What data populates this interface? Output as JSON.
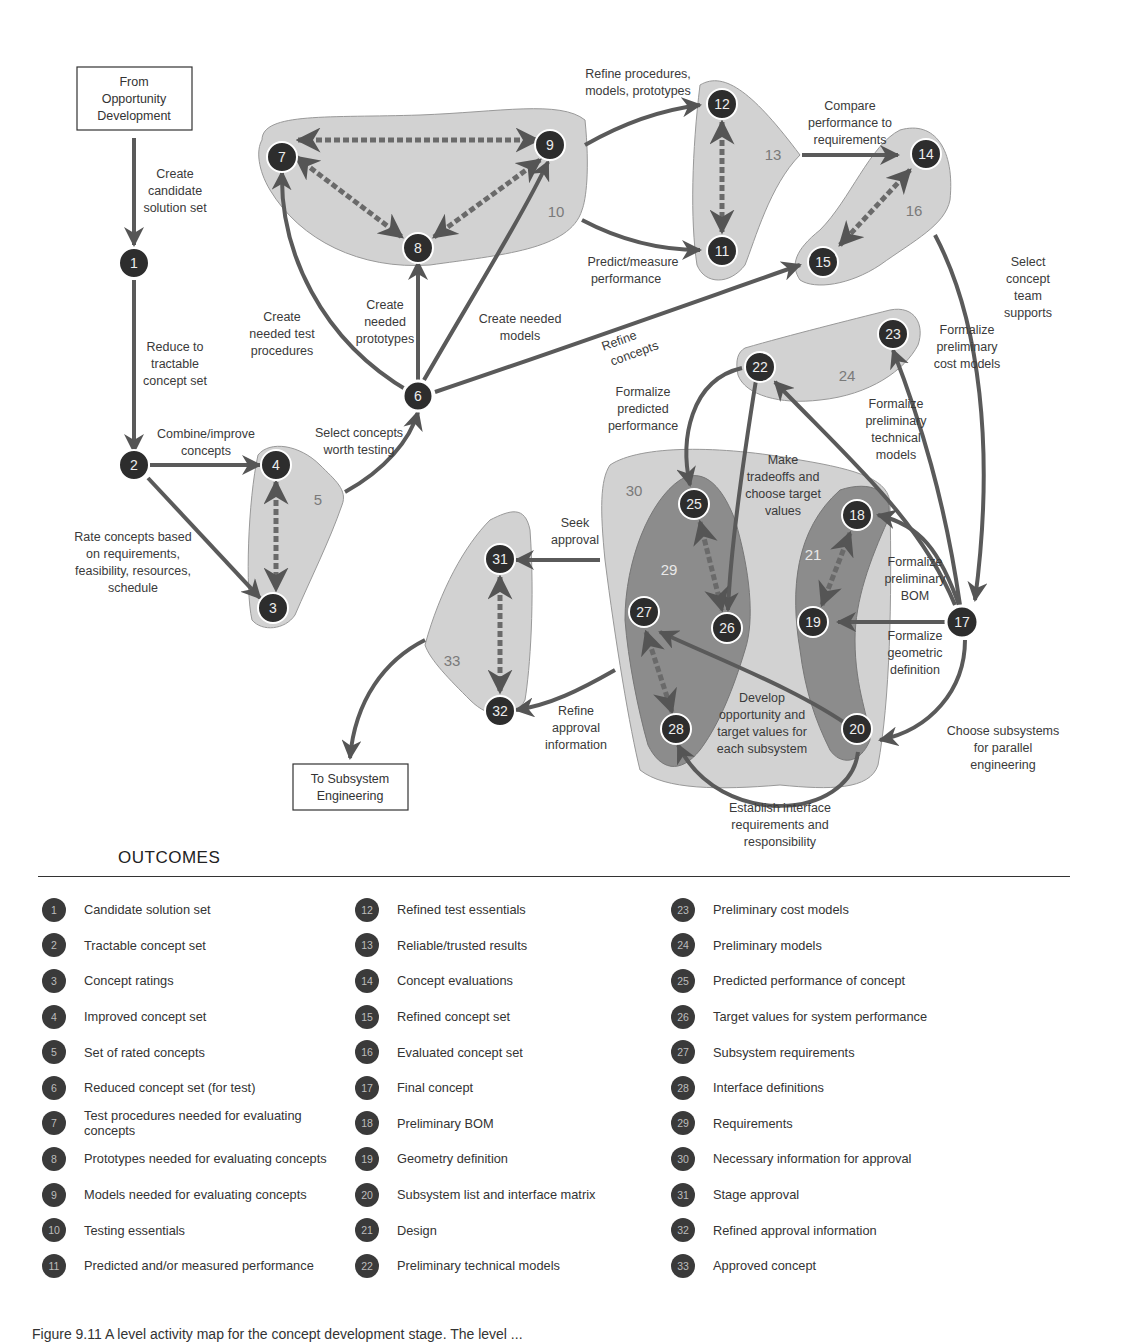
{
  "diagram": {
    "start_box": [
      "From",
      "Opportunity",
      "Development"
    ],
    "end_box": [
      "To Subsystem",
      "Engineering"
    ],
    "groups": [
      {
        "id": "5",
        "label": "5"
      },
      {
        "id": "10",
        "label": "10"
      },
      {
        "id": "13",
        "label": "13"
      },
      {
        "id": "16",
        "label": "16"
      },
      {
        "id": "21",
        "label": "21"
      },
      {
        "id": "24",
        "label": "24"
      },
      {
        "id": "29",
        "label": "29"
      },
      {
        "id": "30",
        "label": "30"
      },
      {
        "id": "33",
        "label": "33"
      }
    ],
    "nodes": {
      "n1": "1",
      "n2": "2",
      "n3": "3",
      "n4": "4",
      "n6": "6",
      "n7": "7",
      "n8": "8",
      "n9": "9",
      "n11": "11",
      "n12": "12",
      "n14": "14",
      "n15": "15",
      "n17": "17",
      "n18": "18",
      "n19": "19",
      "n20": "20",
      "n22": "22",
      "n23": "23",
      "n25": "25",
      "n26": "26",
      "n27": "27",
      "n28": "28",
      "n31": "31",
      "n32": "32"
    },
    "edge_labels": {
      "create_candidate": [
        "Create",
        "candidate",
        "solution set"
      ],
      "reduce": [
        "Reduce to",
        "tractable",
        "concept set"
      ],
      "combine": [
        "Combine/improve",
        "concepts"
      ],
      "rate": [
        "Rate concepts based",
        "on requirements,",
        "feasibility, resources,",
        "schedule"
      ],
      "select_worth": [
        "Select concepts",
        "worth testing"
      ],
      "create_test": [
        "Create",
        "needed test",
        "procedures"
      ],
      "create_proto": [
        "Create",
        "needed",
        "prototypes"
      ],
      "create_models": [
        "Create needed",
        "models"
      ],
      "refine_concepts": [
        "Refine",
        "concepts"
      ],
      "refine_procs": [
        "Refine procedures,",
        "models, prototypes"
      ],
      "predict": [
        "Predict/measure",
        "performance"
      ],
      "compare": [
        "Compare",
        "performance to",
        "requirements"
      ],
      "select_team": [
        "Select",
        "concept",
        "team",
        "supports"
      ],
      "cost_models": [
        "Formalize",
        "preliminary",
        "cost models"
      ],
      "tech_models": [
        "Formalize",
        "preliminary",
        "technical",
        "models"
      ],
      "pred_perf": [
        "Formalize",
        "predicted",
        "performance"
      ],
      "tradeoffs": [
        "Make",
        "tradeoffs and",
        "choose target",
        "values"
      ],
      "bom": [
        "Formalize",
        "preliminary",
        "BOM"
      ],
      "geometric": [
        "Formalize",
        "geometric",
        "definition"
      ],
      "seek": [
        "Seek",
        "approval"
      ],
      "refine_approval": [
        "Refine",
        "approval",
        "information"
      ],
      "develop": [
        "Develop",
        "opportunity and",
        "target values for",
        "each subsystem"
      ],
      "choose_subsystems": [
        "Choose subsystems",
        "for parallel",
        "engineering"
      ],
      "interface": [
        "Establish interface",
        "requirements and",
        "responsibility"
      ]
    }
  },
  "outcomes": {
    "title": "OUTCOMES",
    "columns": [
      [
        {
          "n": "1",
          "text": "Candidate solution set"
        },
        {
          "n": "2",
          "text": "Tractable concept set"
        },
        {
          "n": "3",
          "text": "Concept ratings"
        },
        {
          "n": "4",
          "text": "Improved concept set"
        },
        {
          "n": "5",
          "text": "Set of rated concepts"
        },
        {
          "n": "6",
          "text": "Reduced concept set (for test)"
        },
        {
          "n": "7",
          "text": "Test procedures needed for evaluating concepts"
        },
        {
          "n": "8",
          "text": "Prototypes needed for evaluating concepts"
        },
        {
          "n": "9",
          "text": "Models needed for evaluating concepts"
        },
        {
          "n": "10",
          "text": "Testing essentials"
        },
        {
          "n": "11",
          "text": "Predicted and/or measured performance"
        }
      ],
      [
        {
          "n": "12",
          "text": "Refined test essentials"
        },
        {
          "n": "13",
          "text": "Reliable/trusted results"
        },
        {
          "n": "14",
          "text": "Concept evaluations"
        },
        {
          "n": "15",
          "text": "Refined concept set"
        },
        {
          "n": "16",
          "text": "Evaluated concept set"
        },
        {
          "n": "17",
          "text": "Final concept"
        },
        {
          "n": "18",
          "text": "Preliminary BOM"
        },
        {
          "n": "19",
          "text": "Geometry definition"
        },
        {
          "n": "20",
          "text": "Subsystem list and interface matrix"
        },
        {
          "n": "21",
          "text": "Design"
        },
        {
          "n": "22",
          "text": "Preliminary technical models"
        }
      ],
      [
        {
          "n": "23",
          "text": "Preliminary cost models"
        },
        {
          "n": "24",
          "text": "Preliminary models"
        },
        {
          "n": "25",
          "text": "Predicted performance of concept"
        },
        {
          "n": "26",
          "text": "Target values for system performance"
        },
        {
          "n": "27",
          "text": "Subsystem requirements"
        },
        {
          "n": "28",
          "text": "Interface definitions"
        },
        {
          "n": "29",
          "text": "Requirements"
        },
        {
          "n": "30",
          "text": "Necessary information for approval"
        },
        {
          "n": "31",
          "text": "Stage approval"
        },
        {
          "n": "32",
          "text": "Refined approval information"
        },
        {
          "n": "33",
          "text": "Approved concept"
        }
      ]
    ]
  },
  "caption": "Figure 9.11  A level activity map for the concept development stage. The level ..."
}
